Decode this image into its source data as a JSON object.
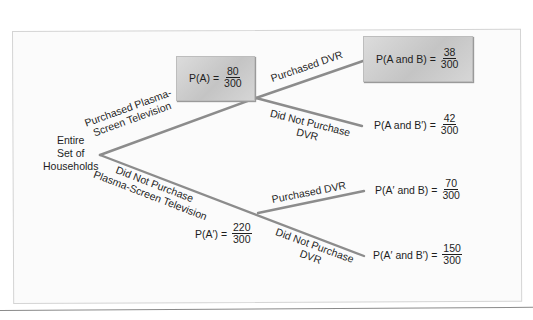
{
  "diagram": {
    "type": "probability-tree",
    "root": {
      "label_lines": [
        "Entire",
        "Set of",
        "Households"
      ]
    },
    "colors": {
      "branch": "#8c8c8c",
      "box_fill": "#cbcbcb",
      "text": "#1e1e1e",
      "frame_border": "#d4d4d4"
    },
    "first_level": [
      {
        "branch_label_lines": [
          "Purchased Plasma-",
          "Screen Television"
        ],
        "prob_lhs": "P(A) =",
        "numerator": "80",
        "denominator": "300",
        "highlighted": true
      },
      {
        "branch_label_lines": [
          "Did Not Purchase",
          "Plasma-Screen Television"
        ],
        "prob_lhs": "P(A′) =",
        "numerator": "220",
        "denominator": "300",
        "highlighted": false
      }
    ],
    "second_level": [
      {
        "branch_label_lines": [
          "Purchased DVR"
        ],
        "prob_lhs": "P(A and B) =",
        "numerator": "38",
        "denominator": "300",
        "highlighted": true
      },
      {
        "branch_label_lines": [
          "Did Not Purchase",
          "DVR"
        ],
        "prob_lhs": "P(A and B′) =",
        "numerator": "42",
        "denominator": "300",
        "highlighted": false
      },
      {
        "branch_label_lines": [
          "Purchased DVR"
        ],
        "prob_lhs": "P(A′ and B) =",
        "numerator": "70",
        "denominator": "300",
        "highlighted": false
      },
      {
        "branch_label_lines": [
          "Did Not Purchase",
          "DVR"
        ],
        "prob_lhs": "P(A′ and B′) =",
        "numerator": "150",
        "denominator": "300",
        "highlighted": false
      }
    ]
  }
}
